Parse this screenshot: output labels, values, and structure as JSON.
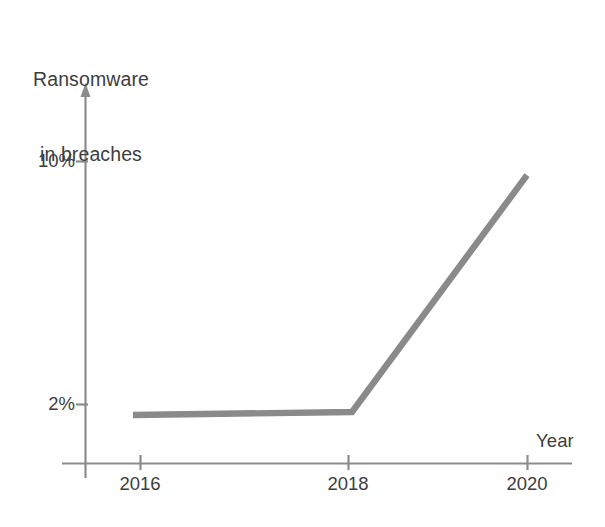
{
  "chart_data": {
    "type": "line",
    "title": "Ransomware in breaches",
    "title_lines": [
      "Ransomware",
      "in breaches"
    ],
    "xlabel": "Year",
    "ylabel": "Ransomware in breaches",
    "x": [
      2016,
      2018,
      2020
    ],
    "categories": [
      "2016",
      "2018",
      "2020"
    ],
    "values": [
      1.9,
      2.0,
      9.8
    ],
    "series": [
      {
        "name": "Ransomware in breaches",
        "values": [
          1.9,
          2.0,
          9.8
        ]
      }
    ],
    "x_tick_labels": [
      "2016",
      "2018",
      "2020"
    ],
    "y_tick_labels": [
      "10%",
      "2%"
    ],
    "y_tick_values": [
      10,
      2
    ],
    "ylim": [
      0,
      12
    ],
    "xlim": [
      2015.5,
      2020.6
    ],
    "grid": false,
    "legend": false,
    "legend_position": "none",
    "line_color": "#8a8a8a",
    "axis_color": "#808080",
    "text_color": "#3d3d3d",
    "background_color": "#ffffff",
    "annotations": []
  },
  "axes": {
    "y_axis_name": "y-axis-line",
    "x_axis_name": "x-axis-line",
    "y_arrow": true,
    "x_arrow": false
  }
}
